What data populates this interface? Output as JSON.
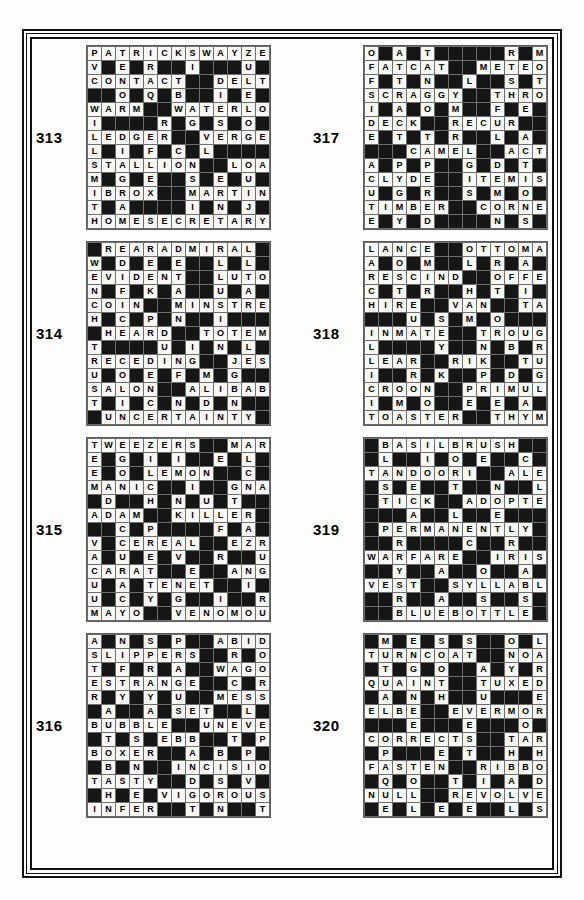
{
  "page": {
    "border_color": "#111111",
    "background_color": "#fdfdfb",
    "light_cell_color": "#f7f7f4",
    "dark_cell_color": "#161616",
    "grid_size": 13
  },
  "puzzles": [
    {
      "number": "313",
      "rows": [
        "PATRICKSWAYZE",
        "V#E#R##I###U#N",
        "CONTACT##DELTA",
        "##O#Q#B##I#E#M",
        "WARM##WATERLOO",
        "I####R#G#S#O#U",
        "LEDGER##VERGER",
        "L#I#F#C#L####E",
        "STALLION##LOAD",
        "M#G#E##S#E#U##",
        "IBROX##MARTINI",
        "T#A####I#N#J#C",
        "HOMESECRETARY"
      ]
    },
    {
      "number": "317",
      "rows": [
        "O#A#T#####R#M#P",
        "FATCAT##METEOR",
        "F#T#N##L##S#T#A",
        "SCRAGGY##THROW",
        "I#A#O#M##F#E##N",
        "DECK##RECUR####",
        "E#T#T#R##L#A###",
        "###CAMEL##ACTS",
        "A#P#P##G#D#T##T",
        "CLYDE##ITEMISE",
        "U#G#R##S#M#O##F",
        "TIMBER##CORNEA",
        "E#Y#D####N#S##N"
      ]
    },
    {
      "number": "314",
      "rows": [
        "#REARADMIRAL##",
        "W#D#E#E##L#L##K",
        "EVIDENT##LUTON",
        "N#F#K#A##U#A##O",
        "COIN##MINSTREL",
        "H#C#P#N##I####L",
        "#HEARD##TOTEM#",
        "T####U#I#N#L##A",
        "RECEDING##JEST",
        "U#O#E#F#M#G###L",
        "SALON##ALIBABA",
        "T#I#C#N#D#N###S",
        "#UNCERTAINTY#"
      ]
    },
    {
      "number": "318",
      "rows": [
        "LANCE##OTTOMAN",
        "A#O#M##L#R#A##O",
        "RESCIND##OFFER",
        "C#T#R##H#T#I##W",
        "HIRE##VAN##TAXI",
        "###U#S#M#O####C",
        "INMATE##TROUGH",
        "L####Y##N#B#R##",
        "LEAR##RIK##TUBA",
        "I##R#K##P#D#G#W",
        "CROON##PRIMULA",
        "I#M#O##E#E#A##K",
        "TOASTER##THYME"
      ]
    },
    {
      "number": "315",
      "rows": [
        "TWEEZERS##MARY",
        "E#G#I#I##E#L#E",
        "E#O#LEMON##C#L",
        "MANIC##I##GNARL",
        "#D##H#N#U#T##O",
        "ADAM##KILLER##W",
        "##C#P####F#A###",
        "V#CEREAL##EZRA",
        "A#U#E#V##R##U##",
        "CARAT##E##ANGEL",
        "U#A#TENET##I##A",
        "U#C#Y#G##I##R#S",
        "MAYO##VENOMOUS"
      ]
    },
    {
      "number": "319",
      "rows": [
        "#BASILBRUSH###",
        "#L##I#O#E##C##R",
        "TANDOORI##ALEC",
        "#S#E##T##N##L#M",
        "#TICK##ADOPTED",
        "###A##L##E####D",
        "#PERMANENTLY##",
        "##R####C##R##A#",
        "WARFARE##IRIS#",
        "##Y##A##O##A#R#O",
        "VEST##SYLLABLE",
        "##R##A##S##S#N#V",
        "##BLUEBOTTLE#"
      ]
    },
    {
      "number": "316",
      "rows": [
        "A#N#S#P##ABIDE",
        "SLIPPERS##R#O#",
        "T#F#R#A##WAGON",
        "ESTRANGE##C#R#",
        "R#Y#Y#U##MESSY",
        "#A##A#SET##L#T#",
        "BUBBLE##UNEVEN",
        "#T#S#EBB##T#P#",
        "BOXER##A#B#P#G",
        "#B#N##INCISION",
        "TASTY##D#S#V##A",
        "#H#E#VIGOROUS",
        "INFER##T#N##T#H"
      ]
    },
    {
      "number": "320",
      "rows": [
        "#M#E#S#S##O#L#",
        "TURNCOAT##NOAH",
        "#T#G#O##A#Y#R#",
        "QUAINT##TUXEDO",
        "#A#N#H##U###E#",
        "ELBE##EVERMORE",
        "###E###E###O###",
        "CORRECTS##TARE",
        "#P###E#T##H#H#",
        "FASTEN##RIBBON",
        "#Q#O##T#I#A#D#",
        "NULL##REVOLVER",
        "#E#L#E#E##L#S#"
      ]
    }
  ]
}
